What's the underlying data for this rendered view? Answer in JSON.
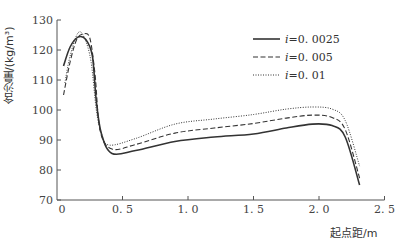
{
  "chart_data": {
    "type": "line",
    "title": "",
    "xlabel": "起点距/m",
    "ylabel": "含沙量/(kg/m³)",
    "xlim": [
      0,
      2.5
    ],
    "ylim": [
      70,
      130
    ],
    "xticks": [
      "0",
      "0.5",
      "1.0",
      "1.5",
      "2.0",
      "2.5"
    ],
    "yticks": [
      "70",
      "80",
      "90",
      "100",
      "110",
      "120",
      "130"
    ],
    "grid": false,
    "legend_position": "upper right",
    "series": [
      {
        "name": "i=0.0025",
        "style": "solid",
        "x": [
          0.05,
          0.1,
          0.16,
          0.22,
          0.27,
          0.3,
          0.34,
          0.42,
          0.6,
          0.9,
          1.2,
          1.5,
          1.75,
          1.95,
          2.1,
          2.2,
          2.31
        ],
        "y": [
          114.7,
          121,
          124.3,
          123.5,
          118,
          103,
          92,
          85.5,
          86.5,
          89.5,
          91,
          92,
          94,
          95.3,
          94.8,
          91,
          75
        ]
      },
      {
        "name": "i=0.005",
        "style": "dashed",
        "x": [
          0.05,
          0.1,
          0.15,
          0.2,
          0.25,
          0.29,
          0.33,
          0.42,
          0.6,
          0.9,
          1.2,
          1.5,
          1.75,
          1.95,
          2.1,
          2.2,
          2.31
        ],
        "y": [
          105,
          116,
          123.5,
          125.3,
          124,
          112,
          93,
          87,
          88.5,
          92.3,
          94,
          95.5,
          97.3,
          98.3,
          97.5,
          93.5,
          77.3
        ]
      },
      {
        "name": "i=0.01",
        "style": "dotted",
        "x": [
          0.06,
          0.1,
          0.16,
          0.21,
          0.26,
          0.3,
          0.34,
          0.4,
          0.6,
          0.9,
          1.2,
          1.5,
          1.75,
          1.95,
          2.1,
          2.2,
          2.31
        ],
        "y": [
          109,
          118,
          125.7,
          124,
          116,
          100,
          92,
          88.3,
          90.5,
          95.3,
          97,
          98.5,
          100.3,
          101,
          100.3,
          96.5,
          81.3
        ]
      }
    ]
  },
  "labels": {
    "xlabel": "起点距/m",
    "ylabel": "含沙量/(kg/m³)"
  },
  "legend": [
    {
      "label": "i=0.0025",
      "style": "solid"
    },
    {
      "label": "i=0.005",
      "style": "dashed"
    },
    {
      "label": "i=0.01",
      "style": "dotted"
    }
  ],
  "colors": {
    "line": "#333333",
    "axis": "#555555"
  }
}
